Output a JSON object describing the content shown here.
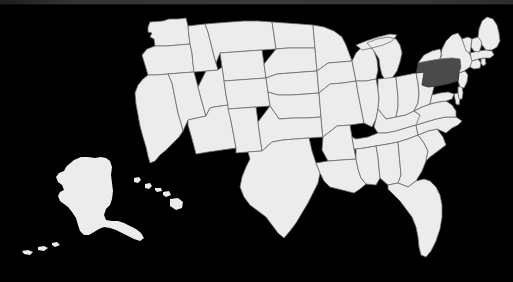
{
  "image": {
    "kind": "choropleth-map",
    "subject": "United States of America",
    "projection_note": "contiguous states with Alaska and Hawaii insets",
    "background_color": "#000000",
    "land_color": "#ececec",
    "border_color": "#6e6e6e",
    "highlight_color": "#4a4a4a",
    "top_strip_color": "#3a3a3a"
  },
  "highlight": {
    "state_name": "Pennsylvania",
    "state_code": "PA",
    "fill": "#4a4a4a"
  },
  "insets": [
    {
      "name": "Alaska",
      "code": "AK"
    },
    {
      "name": "Hawaii",
      "code": "HI"
    }
  ],
  "regions": [
    {
      "code": "WA",
      "name": "Washington",
      "highlighted": false
    },
    {
      "code": "OR",
      "name": "Oregon",
      "highlighted": false
    },
    {
      "code": "CA",
      "name": "California",
      "highlighted": false
    },
    {
      "code": "NV",
      "name": "Nevada",
      "highlighted": false
    },
    {
      "code": "ID",
      "name": "Idaho",
      "highlighted": false
    },
    {
      "code": "MT",
      "name": "Montana",
      "highlighted": false
    },
    {
      "code": "WY",
      "name": "Wyoming",
      "highlighted": false
    },
    {
      "code": "UT",
      "name": "Utah",
      "highlighted": false
    },
    {
      "code": "AZ",
      "name": "Arizona",
      "highlighted": false
    },
    {
      "code": "CO",
      "name": "Colorado",
      "highlighted": false
    },
    {
      "code": "NM",
      "name": "New Mexico",
      "highlighted": false
    },
    {
      "code": "ND",
      "name": "North Dakota",
      "highlighted": false
    },
    {
      "code": "SD",
      "name": "South Dakota",
      "highlighted": false
    },
    {
      "code": "NE",
      "name": "Nebraska",
      "highlighted": false
    },
    {
      "code": "KS",
      "name": "Kansas",
      "highlighted": false
    },
    {
      "code": "OK",
      "name": "Oklahoma",
      "highlighted": false
    },
    {
      "code": "TX",
      "name": "Texas",
      "highlighted": false
    },
    {
      "code": "MN",
      "name": "Minnesota",
      "highlighted": false
    },
    {
      "code": "IA",
      "name": "Iowa",
      "highlighted": false
    },
    {
      "code": "MO",
      "name": "Missouri",
      "highlighted": false
    },
    {
      "code": "AR",
      "name": "Arkansas",
      "highlighted": false
    },
    {
      "code": "LA",
      "name": "Louisiana",
      "highlighted": false
    },
    {
      "code": "WI",
      "name": "Wisconsin",
      "highlighted": false
    },
    {
      "code": "IL",
      "name": "Illinois",
      "highlighted": false
    },
    {
      "code": "MI",
      "name": "Michigan",
      "highlighted": false
    },
    {
      "code": "IN",
      "name": "Indiana",
      "highlighted": false
    },
    {
      "code": "OH",
      "name": "Ohio",
      "highlighted": false
    },
    {
      "code": "KY",
      "name": "Kentucky",
      "highlighted": false
    },
    {
      "code": "TN",
      "name": "Tennessee",
      "highlighted": false
    },
    {
      "code": "MS",
      "name": "Mississippi",
      "highlighted": false
    },
    {
      "code": "AL",
      "name": "Alabama",
      "highlighted": false
    },
    {
      "code": "GA",
      "name": "Georgia",
      "highlighted": false
    },
    {
      "code": "FL",
      "name": "Florida",
      "highlighted": false
    },
    {
      "code": "SC",
      "name": "South Carolina",
      "highlighted": false
    },
    {
      "code": "NC",
      "name": "North Carolina",
      "highlighted": false
    },
    {
      "code": "VA",
      "name": "Virginia",
      "highlighted": false
    },
    {
      "code": "WV",
      "name": "West Virginia",
      "highlighted": false
    },
    {
      "code": "MD",
      "name": "Maryland",
      "highlighted": false
    },
    {
      "code": "DE",
      "name": "Delaware",
      "highlighted": false
    },
    {
      "code": "NJ",
      "name": "New Jersey",
      "highlighted": false
    },
    {
      "code": "PA",
      "name": "Pennsylvania",
      "highlighted": true
    },
    {
      "code": "NY",
      "name": "New York",
      "highlighted": false
    },
    {
      "code": "CT",
      "name": "Connecticut",
      "highlighted": false
    },
    {
      "code": "RI",
      "name": "Rhode Island",
      "highlighted": false
    },
    {
      "code": "MA",
      "name": "Massachusetts",
      "highlighted": false
    },
    {
      "code": "VT",
      "name": "Vermont",
      "highlighted": false
    },
    {
      "code": "NH",
      "name": "New Hampshire",
      "highlighted": false
    },
    {
      "code": "ME",
      "name": "Maine",
      "highlighted": false
    },
    {
      "code": "AK",
      "name": "Alaska",
      "highlighted": false
    },
    {
      "code": "HI",
      "name": "Hawaii",
      "highlighted": false
    }
  ]
}
